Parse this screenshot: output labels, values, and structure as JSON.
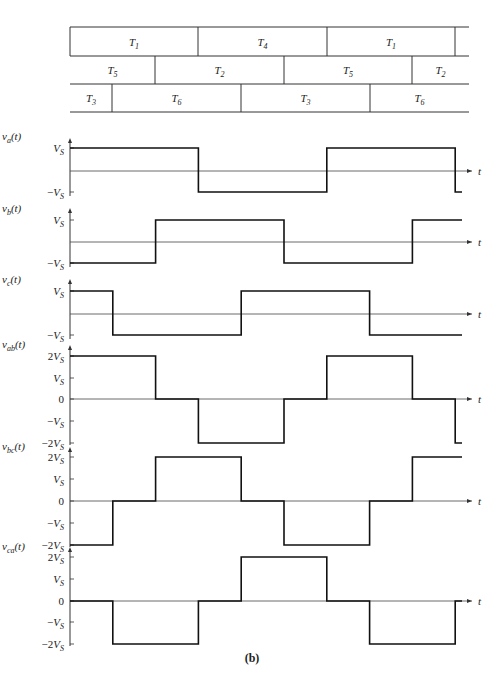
{
  "figure": {
    "caption": "(b)",
    "time_axis_label": "t",
    "switch_table": {
      "rows": [
        {
          "segments": [
            {
              "label": "T",
              "sub": "1",
              "x0": 70,
              "x1": 198
            },
            {
              "label": "T",
              "sub": "4",
              "x0": 198,
              "x1": 327
            },
            {
              "label": "T",
              "sub": "1",
              "x0": 327,
              "x1": 455
            },
            {
              "label": "",
              "sub": "",
              "x0": 455,
              "x1": 469
            }
          ]
        },
        {
          "segments": [
            {
              "label": "T",
              "sub": "5",
              "x0": 70,
              "x1": 155
            },
            {
              "label": "T",
              "sub": "2",
              "x0": 155,
              "x1": 284
            },
            {
              "label": "T",
              "sub": "5",
              "x0": 284,
              "x1": 412
            },
            {
              "label": "T",
              "sub": "2",
              "x0": 412,
              "x1": 469
            }
          ]
        },
        {
          "segments": [
            {
              "label": "T",
              "sub": "3",
              "x0": 70,
              "x1": 112
            },
            {
              "label": "T",
              "sub": "6",
              "x0": 112,
              "x1": 241
            },
            {
              "label": "T",
              "sub": "3",
              "x0": 241,
              "x1": 370
            },
            {
              "label": "T",
              "sub": "6",
              "x0": 370,
              "x1": 469
            }
          ]
        }
      ]
    }
  },
  "chart_data": [
    {
      "type": "line",
      "title": "v_a(t)",
      "ylabel": "v_a(t)",
      "xlabel": "t",
      "yticks": [
        "V_S",
        "-V_S"
      ],
      "x": [
        0,
        1,
        2,
        3,
        4,
        5,
        6,
        7,
        8,
        9
      ],
      "values": [
        1,
        1,
        1,
        -1,
        -1,
        -1,
        1,
        1,
        1,
        -1
      ]
    },
    {
      "type": "line",
      "title": "v_b(t)",
      "ylabel": "v_b(t)",
      "xlabel": "t",
      "yticks": [
        "V_S",
        "-V_S"
      ],
      "x": [
        0,
        1,
        2,
        3,
        4,
        5,
        6,
        7,
        8,
        9
      ],
      "values": [
        -1,
        -1,
        1,
        1,
        1,
        -1,
        -1,
        -1,
        1,
        1
      ]
    },
    {
      "type": "line",
      "title": "v_c(t)",
      "ylabel": "v_c(t)",
      "xlabel": "t",
      "yticks": [
        "V_S",
        "-V_S"
      ],
      "x": [
        0,
        1,
        2,
        3,
        4,
        5,
        6,
        7,
        8,
        9
      ],
      "values": [
        1,
        -1,
        -1,
        -1,
        1,
        1,
        1,
        -1,
        -1,
        -1
      ]
    },
    {
      "type": "line",
      "title": "v_ab(t)",
      "ylabel": "v_ab(t)",
      "xlabel": "t",
      "yticks": [
        "2V_S",
        "V_S",
        "0",
        "-V_S",
        "-2V_S"
      ],
      "x": [
        0,
        1,
        2,
        3,
        4,
        5,
        6,
        7,
        8,
        9
      ],
      "values": [
        2,
        2,
        0,
        -2,
        -2,
        0,
        2,
        2,
        0,
        -2
      ]
    },
    {
      "type": "line",
      "title": "v_bc(t)",
      "ylabel": "v_bc(t)",
      "xlabel": "t",
      "yticks": [
        "2V_S",
        "V_S",
        "0",
        "-V_S",
        "-2V_S"
      ],
      "x": [
        0,
        1,
        2,
        3,
        4,
        5,
        6,
        7,
        8,
        9
      ],
      "values": [
        -2,
        0,
        2,
        2,
        0,
        -2,
        -2,
        0,
        2,
        2
      ]
    },
    {
      "type": "line",
      "title": "v_ca(t)",
      "ylabel": "v_ca(t)",
      "xlabel": "t",
      "yticks": [
        "2V_S",
        "V_S",
        "0",
        "-V_S",
        "-2V_S"
      ],
      "x": [
        0,
        1,
        2,
        3,
        4,
        5,
        6,
        7,
        8,
        9
      ],
      "values": [
        0,
        -2,
        -2,
        0,
        2,
        2,
        0,
        -2,
        -2,
        0
      ]
    }
  ],
  "layout": {
    "x0": 70,
    "step": 42.8,
    "x_end": 462,
    "arrow_end": 472,
    "plots": [
      {
        "name": "va",
        "label": "v",
        "sub": "a",
        "levels": {
          "1": 148,
          "0": 171,
          "-1": 192
        },
        "ticks": [
          [
            "V",
            "S",
            148
          ],
          [
            "−V",
            "S",
            192
          ]
        ],
        "lblY": 140,
        "axisTop": 138,
        "axisBot": 196
      },
      {
        "name": "vb",
        "label": "v",
        "sub": "b",
        "levels": {
          "1": 220,
          "0": 242,
          "-1": 263
        },
        "ticks": [
          [
            "V",
            "S",
            220
          ],
          [
            "−V",
            "S",
            263
          ]
        ],
        "lblY": 212,
        "axisTop": 208,
        "axisBot": 267
      },
      {
        "name": "vc",
        "label": "v",
        "sub": "c",
        "levels": {
          "1": 291,
          "0": 314,
          "-1": 335
        },
        "ticks": [
          [
            "V",
            "S",
            291
          ],
          [
            "−V",
            "S",
            335
          ]
        ],
        "lblY": 283,
        "axisTop": 279,
        "axisBot": 339
      },
      {
        "name": "vab",
        "label": "v",
        "sub": "ab",
        "levels": {
          "2": 356,
          "1": 378,
          "0": 399,
          "-1": 421,
          "-2": 443
        },
        "ticks": [
          [
            "2V",
            "S",
            356
          ],
          [
            "V",
            "S",
            378
          ],
          [
            "0",
            "",
            399
          ],
          [
            "−V",
            "S",
            421
          ],
          [
            "−2V",
            "S",
            443
          ]
        ],
        "lblY": 348,
        "axisTop": 345,
        "axisBot": 445
      },
      {
        "name": "vbc",
        "label": "v",
        "sub": "bc",
        "levels": {
          "2": 457,
          "1": 479,
          "0": 501,
          "-1": 523,
          "-2": 545
        },
        "ticks": [
          [
            "2V",
            "S",
            457
          ],
          [
            "V",
            "S",
            479
          ],
          [
            "0",
            "",
            501
          ],
          [
            "−V",
            "S",
            523
          ],
          [
            "−2V",
            "S",
            545
          ]
        ],
        "lblY": 450,
        "axisTop": 447,
        "axisBot": 547
      },
      {
        "name": "vca",
        "label": "v",
        "sub": "ca",
        "levels": {
          "2": 557,
          "1": 579,
          "0": 601,
          "-1": 622,
          "-2": 644
        },
        "ticks": [
          [
            "2V",
            "S",
            557
          ],
          [
            "V",
            "S",
            579
          ],
          [
            "0",
            "",
            601
          ],
          [
            "−V",
            "S",
            622
          ],
          [
            "−2V",
            "S",
            644
          ]
        ],
        "lblY": 550,
        "axisTop": 547,
        "axisBot": 646
      }
    ]
  }
}
